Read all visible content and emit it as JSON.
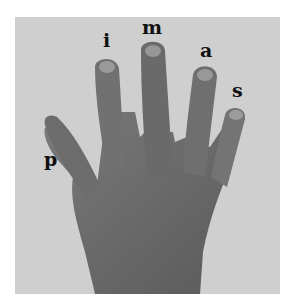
{
  "figure": {
    "background_color": "#cfcfcf",
    "hand_color": "#6e6e6e",
    "labels": [
      {
        "finger": "thumb",
        "text": "p"
      },
      {
        "finger": "index",
        "text": "i"
      },
      {
        "finger": "middle",
        "text": "m"
      },
      {
        "finger": "ring",
        "text": "a"
      },
      {
        "finger": "little",
        "text": "s"
      }
    ]
  }
}
